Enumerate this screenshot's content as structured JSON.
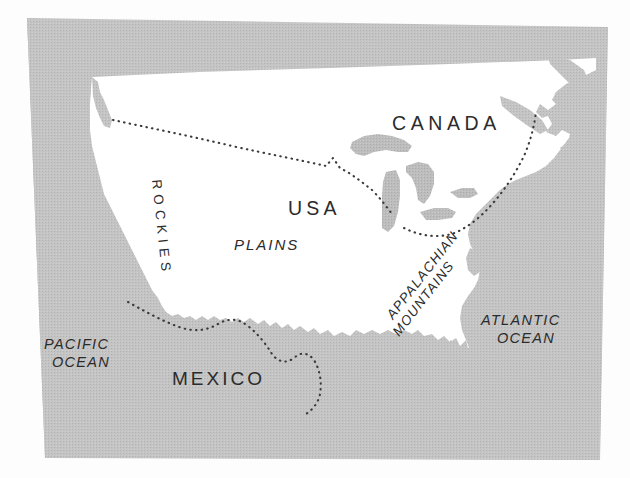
{
  "figure": {
    "kind": "reference-map",
    "projection_note": "stylized outline map, plate tilted slightly clockwise"
  },
  "colors": {
    "ocean_fill": "#c0c0c0",
    "land_fill": "#ffffff",
    "lake_fill": "#bdbdbd",
    "label_text": "#2b2b2b",
    "page_background": "#fdfdfd",
    "border_dots": "#3a3a3a"
  },
  "labels": {
    "canada": "CANADA",
    "usa": "USA",
    "mexico": "MEXICO",
    "plains": "PLAINS",
    "rockies": "R O C K I E S",
    "rockies_plain": "ROCKIES",
    "appalachian_line1": "APPALACHIAN",
    "appalachian_line2": "MOUNTAINS",
    "pacific_line1": "PACIFIC",
    "pacific_line2": "OCEAN",
    "atlantic_line1": "ATLANTIC",
    "atlantic_line2": "OCEAN"
  },
  "features": {
    "countries": [
      "CANADA",
      "USA",
      "MEXICO"
    ],
    "oceans": [
      "PACIFIC OCEAN",
      "ATLANTIC OCEAN"
    ],
    "landforms": [
      "ROCKIES",
      "PLAINS",
      "APPALACHIAN MOUNTAINS"
    ],
    "boundaries": [
      "USA-Canada border",
      "USA-Mexico border"
    ],
    "water_bodies": [
      "Great Lakes",
      "Gulf of California",
      "Gulf of Mexico"
    ]
  },
  "styles": {
    "country_label_case": "uppercase",
    "landform_label_style": "italic",
    "ocean_label_style": "italic",
    "border_style": "dotted"
  }
}
